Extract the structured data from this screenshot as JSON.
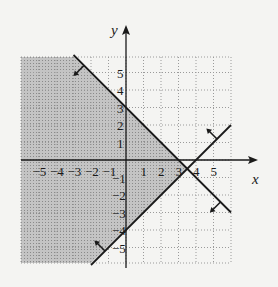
{
  "chart_data": {
    "type": "inequality-graph",
    "title": "",
    "xlabel": "x",
    "ylabel": "y",
    "xlim": [
      -6,
      6
    ],
    "ylim": [
      -6,
      6
    ],
    "grid": true,
    "x_ticks": [
      -5,
      -4,
      -3,
      -2,
      -1,
      1,
      2,
      3,
      4,
      5
    ],
    "y_ticks": [
      -5,
      -4,
      -3,
      -2,
      -1,
      1,
      2,
      3,
      4,
      5
    ],
    "x_tick_labels": [
      "−5",
      "−4",
      "−3",
      "−2",
      "−1",
      "1",
      "2",
      "3",
      "4",
      "5"
    ],
    "y_tick_labels": [
      "−5",
      "−4",
      "−3",
      "−2",
      "−1",
      "1",
      "2",
      "3",
      "4",
      "5"
    ],
    "lines": [
      {
        "name": "boundary-1",
        "equation": "x + y = 3",
        "slope": -1,
        "intercept": 3,
        "from": [
          -3,
          6
        ],
        "to": [
          6,
          -3
        ],
        "shade_side": "below-left"
      },
      {
        "name": "boundary-2",
        "equation": "y = x - 4",
        "slope": 1,
        "intercept": -4,
        "from": [
          -2,
          -6
        ],
        "to": [
          6,
          2
        ],
        "shade_side": "above-left"
      }
    ],
    "shaded_region": "x + y <= 3 and y >= x - 4",
    "intersection": [
      3.5,
      -0.5
    ],
    "colors": {
      "shade": "#b8b8b8",
      "line": "#1a1a1a",
      "grid": "#9a9a9a",
      "background": "#f4f4f2"
    }
  },
  "labels": {
    "x_axis": "x",
    "y_axis": "y"
  }
}
